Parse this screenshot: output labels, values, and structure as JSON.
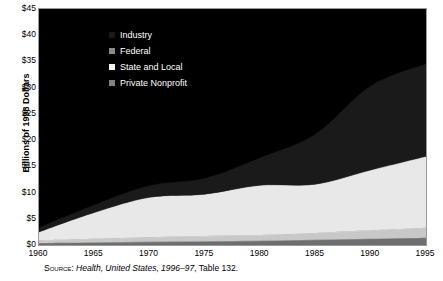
{
  "chart_data": {
    "type": "area",
    "title": "",
    "xlabel": "",
    "ylabel": "Billions of 1998 Dollars",
    "xlim": [
      1960,
      1995
    ],
    "ylim": [
      0,
      45
    ],
    "ytick_labels": [
      "$0",
      "$5",
      "$10",
      "$15",
      "$20",
      "$25",
      "$30",
      "$35",
      "$40",
      "$45"
    ],
    "ytick_values": [
      0,
      5,
      10,
      15,
      20,
      25,
      30,
      35,
      40,
      45
    ],
    "xtick_labels": [
      "1960",
      "1965",
      "1970",
      "1975",
      "1980",
      "1985",
      "1990",
      "1995"
    ],
    "xtick_values": [
      1960,
      1965,
      1970,
      1975,
      1980,
      1985,
      1990,
      1995
    ],
    "grid": false,
    "stacked": true,
    "legend_position": "upper-left-inside",
    "plot_background": "#000000",
    "x": [
      1960,
      1965,
      1970,
      1975,
      1980,
      1985,
      1990,
      1995
    ],
    "series": [
      {
        "name": "Private Nonprofit",
        "color": "#6e6e6e",
        "values": [
          0.4,
          0.5,
          0.6,
          0.7,
          0.8,
          1.0,
          1.2,
          1.4
        ]
      },
      {
        "name": "State and Local",
        "color": "#c8c8c8",
        "values": [
          0.5,
          0.7,
          0.9,
          1.0,
          1.1,
          1.3,
          1.6,
          1.9
        ]
      },
      {
        "name": "Federal",
        "color": "#e8e8e8",
        "values": [
          1.6,
          5.0,
          7.6,
          8.0,
          9.5,
          9.3,
          11.5,
          13.6
        ]
      },
      {
        "name": "Industry",
        "color": "#1a1a1a",
        "values": [
          0.8,
          1.4,
          2.2,
          3.0,
          5.2,
          9.5,
          16.0,
          17.6
        ]
      }
    ],
    "totals": [
      3.3,
      7.6,
      11.3,
      12.7,
      16.6,
      21.1,
      30.3,
      34.5
    ]
  },
  "legend": {
    "items": [
      {
        "label": "Industry",
        "swatch": "#1a1a1a"
      },
      {
        "label": "Federal",
        "swatch": "#8a8a8a"
      },
      {
        "label": "State and Local",
        "swatch": "#f2f2f2"
      },
      {
        "label": "Private Nonprofit",
        "swatch": "#808080"
      }
    ]
  },
  "source": {
    "prefix": "Source:",
    "publication": "Health, United States, 1996–97",
    "suffix": ", Table 132."
  }
}
